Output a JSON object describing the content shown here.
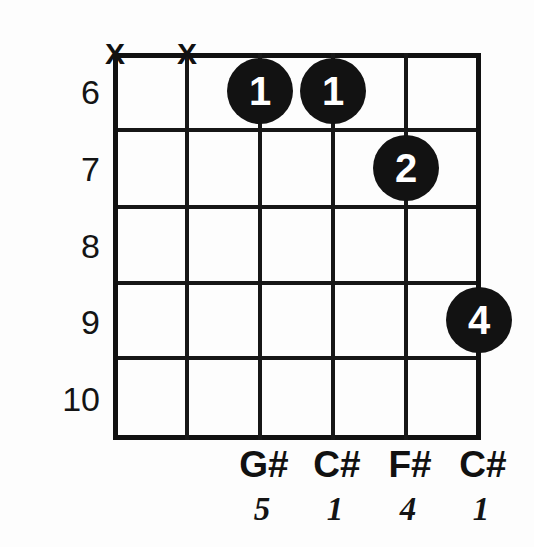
{
  "diagram": {
    "type": "guitar-chord-diagram",
    "title": "",
    "strings": 6,
    "frets_shown": 5,
    "grid": {
      "left": 113,
      "top": 53,
      "width": 368,
      "height": 387,
      "string_x": [
        115,
        187,
        260,
        333,
        406,
        479
      ],
      "fret_y": [
        55,
        130,
        207,
        283,
        358,
        438
      ]
    },
    "fret_numbers": [
      "6",
      "7",
      "8",
      "9",
      "10"
    ],
    "muted_strings": [
      {
        "label": "X",
        "string_index": 0,
        "x": 115
      },
      {
        "label": "X",
        "string_index": 1,
        "x": 187
      }
    ],
    "finger_dots": [
      {
        "finger": "1",
        "string_index": 2,
        "fret_number": "6",
        "cx": 260,
        "cy": 91
      },
      {
        "finger": "1",
        "string_index": 3,
        "fret_number": "6",
        "cx": 333,
        "cy": 91
      },
      {
        "finger": "2",
        "string_index": 4,
        "fret_number": "7",
        "cx": 406,
        "cy": 168
      },
      {
        "finger": "4",
        "string_index": 5,
        "fret_number": "9",
        "cx": 479,
        "cy": 320
      }
    ],
    "note_names": [
      {
        "note": "G#",
        "string_index": 2,
        "x": 260
      },
      {
        "note": "C#",
        "string_index": 3,
        "x": 333
      },
      {
        "note": "F#",
        "string_index": 4,
        "x": 406
      },
      {
        "note": "C#",
        "string_index": 5,
        "x": 479
      }
    ],
    "intervals": [
      {
        "degree": "5",
        "string_index": 2,
        "x": 260
      },
      {
        "degree": "1",
        "string_index": 3,
        "x": 333
      },
      {
        "degree": "4",
        "string_index": 4,
        "x": 406
      },
      {
        "degree": "1",
        "string_index": 5,
        "x": 479
      }
    ],
    "colors": {
      "line": "#171717",
      "dot_fill": "#121212",
      "dot_text": "#ffffff",
      "text": "#111111",
      "background": "#fdfdfd"
    }
  }
}
